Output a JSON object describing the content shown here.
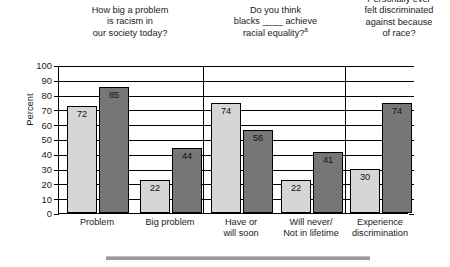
{
  "chart_data": {
    "type": "bar",
    "title": "",
    "xlabel": "",
    "ylabel": "Percent",
    "ylim": [
      0,
      100
    ],
    "ytick_step": 10,
    "yticks": [
      100,
      90,
      80,
      70,
      60,
      50,
      40,
      30,
      20,
      10,
      0
    ],
    "grid": true,
    "legend": null,
    "legend_position": "none",
    "categories": [
      "Problem",
      "Big problem",
      "Have or\nwill soon",
      "Will never/\nNot in lifetime",
      "Experience\ndiscrimination"
    ],
    "series": [
      {
        "name": "light-series",
        "color": "#d6d6d6",
        "values": [
          72,
          22,
          74,
          22,
          30
        ]
      },
      {
        "name": "dark-series",
        "color": "#767676",
        "values": [
          85,
          44,
          56,
          41,
          74
        ]
      }
    ],
    "panels": [
      {
        "question": "How big a problem\nis racism in\nour society today?",
        "categories": [
          "Problem",
          "Big problem"
        ]
      },
      {
        "question": "Do you think\nblacks ____ achieve\nracial equality?",
        "question_footnote": "a",
        "categories": [
          "Have or\nwill soon",
          "Will never/\nNot in lifetime"
        ]
      },
      {
        "question": "Personally ever\nfelt discriminated\nagainst because\nof race?",
        "categories": [
          "Experience\ndiscrimination"
        ]
      }
    ],
    "bar_labels": {
      "group1": {
        "light": "72",
        "dark": "85"
      },
      "group2": {
        "light": "22",
        "dark": "44"
      },
      "group3": {
        "light": "74",
        "dark": "56"
      },
      "group4": {
        "light": "22",
        "dark": "41"
      },
      "group5": {
        "light": "30",
        "dark": "74"
      }
    },
    "colors": {
      "light_bar": "#d6d6d6",
      "dark_bar": "#767676",
      "axis": "#000000",
      "grid": "#000000",
      "bottom_rule": "#9a9a9a",
      "background": "#ffffff"
    }
  }
}
